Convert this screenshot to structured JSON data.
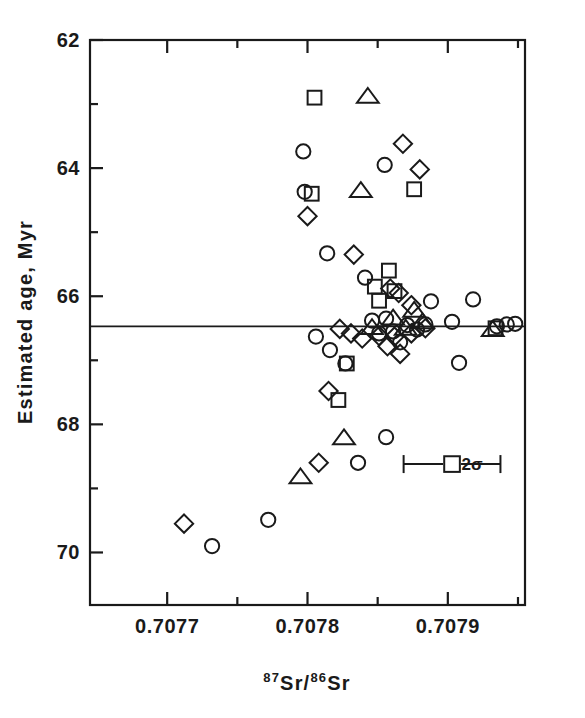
{
  "figure": {
    "background_color": "#ffffff",
    "ink_color": "#1a1a1a"
  },
  "axes": {
    "x_title_main_1": "Sr/",
    "x_title_sup_1": "87",
    "x_title_sup_2": "86",
    "x_title_main_2": "Sr",
    "x_title_plain": "87Sr/86Sr",
    "y_title": "Estimated age, Myr",
    "x_tick_labels": [
      "0.7077",
      "0.7078",
      "0.7079"
    ],
    "y_tick_labels": [
      "62",
      "64",
      "66",
      "68",
      "70"
    ]
  },
  "annotations": {
    "error_bar_label": "2σ"
  },
  "chart_data": {
    "type": "scatter",
    "title": "",
    "xlabel": "87Sr/86Sr",
    "ylabel": "Estimated age, Myr",
    "xlim": [
      0.707645,
      0.707955
    ],
    "ylim": [
      70.82,
      62.0
    ],
    "y_inverted": true,
    "grid": false,
    "legend": "none",
    "x_ticks_major": [
      0.7077,
      0.7078,
      0.7079
    ],
    "x_ticks_minor": [
      0.70775,
      0.70785,
      0.70795
    ],
    "y_ticks_major": [
      62,
      64,
      66,
      68,
      70
    ],
    "y_ticks_minor": [
      63,
      65,
      67,
      69
    ],
    "reference_line": {
      "orientation": "horizontal",
      "y": 66.47,
      "label": ""
    },
    "error_bar": {
      "x": 0.707903,
      "y": 68.62,
      "x_half_width": 3.45e-05,
      "marker": "square",
      "label": "2σ"
    },
    "series": [
      {
        "name": "circle",
        "marker": "circle",
        "points": [
          [
            0.707797,
            63.74
          ],
          [
            0.707798,
            64.37
          ],
          [
            0.707814,
            65.33
          ],
          [
            0.707841,
            65.71
          ],
          [
            0.707855,
            63.95
          ],
          [
            0.707816,
            66.84
          ],
          [
            0.707827,
            67.05
          ],
          [
            0.707888,
            66.08
          ],
          [
            0.707861,
            66.55
          ],
          [
            0.707871,
            66.45
          ],
          [
            0.707878,
            66.52
          ],
          [
            0.707884,
            66.44
          ],
          [
            0.707866,
            66.72
          ],
          [
            0.707851,
            66.58
          ],
          [
            0.707846,
            66.38
          ],
          [
            0.707856,
            66.35
          ],
          [
            0.707903,
            66.4
          ],
          [
            0.707918,
            66.05
          ],
          [
            0.707908,
            67.04
          ],
          [
            0.707935,
            66.47
          ],
          [
            0.707942,
            66.44
          ],
          [
            0.707948,
            66.43
          ],
          [
            0.707856,
            68.2
          ],
          [
            0.707836,
            68.6
          ],
          [
            0.707772,
            69.49
          ],
          [
            0.707732,
            69.9
          ],
          [
            0.707806,
            66.63
          ]
        ]
      },
      {
        "name": "square",
        "marker": "square",
        "points": [
          [
            0.707805,
            62.9
          ],
          [
            0.707803,
            64.4
          ],
          [
            0.707876,
            64.33
          ],
          [
            0.707858,
            65.6
          ],
          [
            0.707848,
            65.85
          ],
          [
            0.707851,
            66.07
          ],
          [
            0.707862,
            65.92
          ],
          [
            0.707828,
            67.05
          ],
          [
            0.707822,
            67.62
          ],
          [
            0.707934,
            66.5
          ]
        ]
      },
      {
        "name": "triangle",
        "marker": "triangle",
        "points": [
          [
            0.707843,
            62.88
          ],
          [
            0.707838,
            64.35
          ],
          [
            0.707861,
            66.34
          ],
          [
            0.707876,
            66.22
          ],
          [
            0.707882,
            66.4
          ],
          [
            0.70787,
            66.5
          ],
          [
            0.707846,
            66.49
          ],
          [
            0.707826,
            68.21
          ],
          [
            0.707795,
            68.82
          ],
          [
            0.707932,
            66.52
          ]
        ]
      },
      {
        "name": "diamond",
        "marker": "diamond",
        "points": [
          [
            0.707868,
            63.62
          ],
          [
            0.70788,
            64.02
          ],
          [
            0.7078,
            64.75
          ],
          [
            0.707833,
            65.35
          ],
          [
            0.707859,
            65.88
          ],
          [
            0.707865,
            65.95
          ],
          [
            0.707874,
            66.14
          ],
          [
            0.707823,
            66.51
          ],
          [
            0.707831,
            66.58
          ],
          [
            0.707839,
            66.66
          ],
          [
            0.707851,
            66.62
          ],
          [
            0.707862,
            66.63
          ],
          [
            0.707874,
            66.58
          ],
          [
            0.707884,
            66.5
          ],
          [
            0.707857,
            66.78
          ],
          [
            0.707866,
            66.9
          ],
          [
            0.707815,
            67.48
          ],
          [
            0.707808,
            68.6
          ],
          [
            0.707712,
            69.55
          ]
        ]
      }
    ]
  }
}
